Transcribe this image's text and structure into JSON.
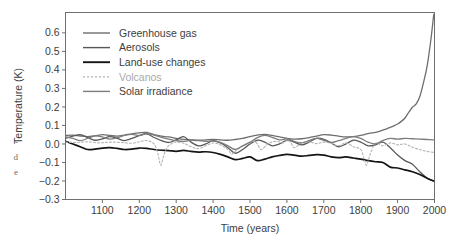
{
  "figure": {
    "caption_fragments": [
      ",",
      "-",
      "d",
      "e"
    ]
  },
  "chart_data": {
    "type": "line",
    "title": "",
    "xlabel": "Time (years)",
    "ylabel": "Temperature (K)",
    "xlim": [
      1000,
      2000
    ],
    "ylim": [
      -0.3,
      0.71
    ],
    "xticks": [
      1100,
      1200,
      1300,
      1400,
      1500,
      1600,
      1700,
      1800,
      1900,
      2000
    ],
    "xtick_labels": [
      "1100",
      "1200",
      "1300",
      "1400",
      "1500",
      "1600",
      "1700",
      "1800",
      "1900",
      "2000"
    ],
    "yticks": [
      -0.3,
      -0.2,
      -0.1,
      0.0,
      0.1,
      0.2,
      0.3,
      0.4,
      0.5,
      0.6
    ],
    "ytick_labels": [
      "-0.3",
      "-0.2",
      "-0.1",
      "0.0",
      "0.1",
      "0.2",
      "0.3",
      "0.4",
      "0.5",
      "0.6"
    ],
    "grid": false,
    "legend_position": "upper-left",
    "series": [
      {
        "name": "Greenhouse gas",
        "color": "#6e6e6e",
        "width": 1.3,
        "dash": "none",
        "x": [
          1000,
          1020,
          1040,
          1060,
          1080,
          1100,
          1120,
          1140,
          1160,
          1180,
          1200,
          1220,
          1240,
          1260,
          1280,
          1300,
          1320,
          1340,
          1360,
          1380,
          1400,
          1420,
          1440,
          1460,
          1480,
          1500,
          1520,
          1540,
          1560,
          1580,
          1600,
          1620,
          1640,
          1660,
          1680,
          1700,
          1720,
          1740,
          1760,
          1780,
          1800,
          1820,
          1840,
          1850,
          1860,
          1870,
          1880,
          1890,
          1900,
          1910,
          1920,
          1930,
          1940,
          1950,
          1960,
          1970,
          1980,
          1990,
          1998
        ],
        "y": [
          0.045,
          0.048,
          0.043,
          0.04,
          0.044,
          0.05,
          0.046,
          0.042,
          0.048,
          0.055,
          0.06,
          0.062,
          0.05,
          0.042,
          0.038,
          0.03,
          0.025,
          0.022,
          0.02,
          0.022,
          0.024,
          0.022,
          0.02,
          0.024,
          0.03,
          0.04,
          0.048,
          0.052,
          0.046,
          0.038,
          0.03,
          0.026,
          0.028,
          0.034,
          0.042,
          0.05,
          0.048,
          0.042,
          0.038,
          0.04,
          0.046,
          0.056,
          0.062,
          0.068,
          0.075,
          0.082,
          0.09,
          0.098,
          0.108,
          0.122,
          0.14,
          0.17,
          0.198,
          0.215,
          0.255,
          0.33,
          0.42,
          0.56,
          0.7
        ]
      },
      {
        "name": "Aerosols",
        "color": "#585858",
        "width": 1.3,
        "dash": "none",
        "x": [
          1000,
          1020,
          1040,
          1060,
          1080,
          1100,
          1120,
          1140,
          1160,
          1180,
          1200,
          1220,
          1240,
          1260,
          1280,
          1300,
          1320,
          1340,
          1360,
          1380,
          1400,
          1420,
          1440,
          1460,
          1480,
          1500,
          1520,
          1540,
          1560,
          1580,
          1600,
          1620,
          1640,
          1660,
          1680,
          1700,
          1720,
          1740,
          1760,
          1780,
          1800,
          1820,
          1840,
          1860,
          1880,
          1900,
          1920,
          1940,
          1960,
          1980,
          1998
        ],
        "y": [
          0.03,
          0.042,
          0.05,
          0.035,
          0.02,
          0.028,
          0.04,
          0.03,
          0.018,
          0.03,
          0.045,
          0.055,
          0.035,
          0.018,
          0.008,
          0.022,
          0.04,
          0.01,
          -0.01,
          0.0,
          0.018,
          0.005,
          -0.02,
          -0.05,
          -0.03,
          0.0,
          0.02,
          0.01,
          -0.01,
          0.0,
          0.02,
          0.01,
          -0.005,
          0.01,
          0.03,
          0.025,
          0.005,
          -0.015,
          0.0,
          0.02,
          0.01,
          -0.01,
          -0.005,
          0.01,
          -0.02,
          -0.06,
          -0.09,
          -0.11,
          -0.15,
          -0.185,
          -0.2
        ]
      },
      {
        "name": "Land-use changes",
        "color": "#151515",
        "width": 1.7,
        "dash": "none",
        "x": [
          1000,
          1020,
          1040,
          1060,
          1080,
          1100,
          1120,
          1140,
          1160,
          1180,
          1200,
          1220,
          1240,
          1260,
          1280,
          1300,
          1320,
          1340,
          1360,
          1380,
          1400,
          1420,
          1440,
          1460,
          1480,
          1500,
          1520,
          1540,
          1560,
          1580,
          1600,
          1620,
          1640,
          1660,
          1680,
          1700,
          1720,
          1740,
          1760,
          1780,
          1800,
          1820,
          1840,
          1860,
          1880,
          1900,
          1920,
          1940,
          1960,
          1980,
          1998
        ],
        "y": [
          0.015,
          0.0,
          -0.015,
          -0.03,
          -0.028,
          -0.022,
          -0.02,
          -0.024,
          -0.03,
          -0.028,
          -0.022,
          -0.024,
          -0.03,
          -0.034,
          -0.036,
          -0.04,
          -0.035,
          -0.04,
          -0.044,
          -0.042,
          -0.046,
          -0.056,
          -0.07,
          -0.085,
          -0.078,
          -0.07,
          -0.09,
          -0.082,
          -0.07,
          -0.062,
          -0.056,
          -0.06,
          -0.066,
          -0.062,
          -0.058,
          -0.06,
          -0.07,
          -0.074,
          -0.07,
          -0.076,
          -0.082,
          -0.09,
          -0.096,
          -0.1,
          -0.125,
          -0.13,
          -0.14,
          -0.15,
          -0.165,
          -0.185,
          -0.2
        ]
      },
      {
        "name": "Volcanos",
        "color": "#b4b4b4",
        "width": 1.1,
        "dash": "2,2",
        "x": [
          1000,
          1030,
          1060,
          1090,
          1120,
          1150,
          1180,
          1200,
          1220,
          1240,
          1250,
          1258,
          1265,
          1275,
          1290,
          1300,
          1320,
          1340,
          1360,
          1380,
          1400,
          1420,
          1440,
          1450,
          1460,
          1480,
          1500,
          1510,
          1520,
          1530,
          1550,
          1570,
          1590,
          1600,
          1610,
          1620,
          1640,
          1660,
          1680,
          1700,
          1720,
          1740,
          1760,
          1780,
          1800,
          1810,
          1816,
          1825,
          1840,
          1860,
          1880,
          1900,
          1920,
          1940,
          1960,
          1980,
          1998
        ],
        "y": [
          0.01,
          0.008,
          0.012,
          0.006,
          0.01,
          0.008,
          0.004,
          0.012,
          0.018,
          0.0,
          -0.05,
          -0.115,
          -0.07,
          -0.02,
          0.005,
          0.01,
          0.004,
          -0.015,
          -0.025,
          -0.01,
          0.005,
          -0.005,
          -0.03,
          -0.055,
          -0.04,
          -0.012,
          0.006,
          0.014,
          0.0,
          -0.03,
          0.002,
          0.014,
          0.006,
          0.02,
          0.01,
          -0.02,
          0.006,
          0.012,
          0.002,
          0.01,
          0.004,
          -0.01,
          0.006,
          -0.015,
          -0.03,
          -0.085,
          -0.115,
          -0.06,
          0.004,
          -0.01,
          0.006,
          -0.005,
          0.0,
          -0.018,
          -0.03,
          -0.04,
          -0.046
        ]
      },
      {
        "name": "Solar irradiance",
        "color": "#7d7d7d",
        "width": 1.3,
        "dash": "none",
        "x": [
          1000,
          1020,
          1040,
          1060,
          1080,
          1100,
          1120,
          1140,
          1160,
          1180,
          1200,
          1220,
          1240,
          1260,
          1280,
          1300,
          1320,
          1340,
          1360,
          1380,
          1400,
          1420,
          1440,
          1460,
          1480,
          1500,
          1520,
          1540,
          1560,
          1580,
          1600,
          1620,
          1640,
          1660,
          1680,
          1700,
          1720,
          1740,
          1760,
          1780,
          1800,
          1820,
          1840,
          1860,
          1880,
          1900,
          1920,
          1940,
          1960,
          1980,
          1998
        ],
        "y": [
          0.038,
          0.03,
          0.018,
          0.03,
          0.044,
          0.038,
          0.026,
          0.034,
          0.046,
          0.052,
          0.046,
          0.056,
          0.048,
          0.036,
          0.026,
          0.018,
          0.014,
          0.02,
          0.018,
          0.014,
          0.016,
          0.008,
          -0.01,
          -0.03,
          -0.01,
          0.01,
          0.034,
          0.046,
          0.036,
          0.022,
          0.028,
          0.014,
          0.006,
          0.018,
          0.03,
          0.02,
          0.008,
          0.018,
          0.03,
          0.04,
          0.03,
          0.01,
          0.0,
          0.018,
          0.03,
          0.026,
          0.03,
          0.028,
          0.026,
          0.024,
          0.022
        ]
      }
    ],
    "legend": [
      {
        "label": "Greenhouse gas",
        "color": "#6e6e6e",
        "dash": "none",
        "width": 1.4,
        "muted": false
      },
      {
        "label": "Aerosols",
        "color": "#585858",
        "dash": "none",
        "width": 1.4,
        "muted": false
      },
      {
        "label": "Land-use changes",
        "color": "#151515",
        "dash": "none",
        "width": 1.9,
        "muted": false
      },
      {
        "label": "Volcanos",
        "color": "#b4b4b4",
        "dash": "2,2",
        "width": 1.2,
        "muted": true
      },
      {
        "label": "Solar irradiance",
        "color": "#7d7d7d",
        "dash": "none",
        "width": 1.4,
        "muted": false
      }
    ]
  }
}
